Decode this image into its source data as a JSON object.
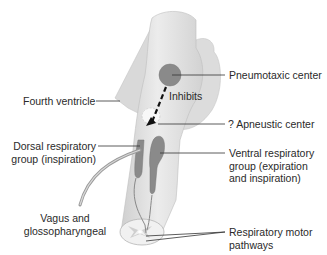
{
  "diagram": {
    "labels": {
      "pneumotaxic": "Pneumotaxic center",
      "inhibits": "Inhibits",
      "fourth_ventricle": "Fourth ventricle",
      "apneustic": "? Apneustic center",
      "dorsal_line1": "Dorsal respiratory",
      "dorsal_line2": "group (inspiration)",
      "ventral_line1": "Ventral respiratory",
      "ventral_line2": "group (expiration",
      "ventral_line3": "and inspiration)",
      "vagus_line1": "Vagus and",
      "vagus_line2": "glossopharyngeal",
      "motor_line1": "Respiratory motor",
      "motor_line2": "pathways"
    },
    "colors": {
      "brainstem": "#e4e4e4",
      "brainstem_shade": "#c9c9c9",
      "center_fill": "#8a8a8a",
      "leader_line": "#333333",
      "text": "#2a2a2a"
    }
  }
}
